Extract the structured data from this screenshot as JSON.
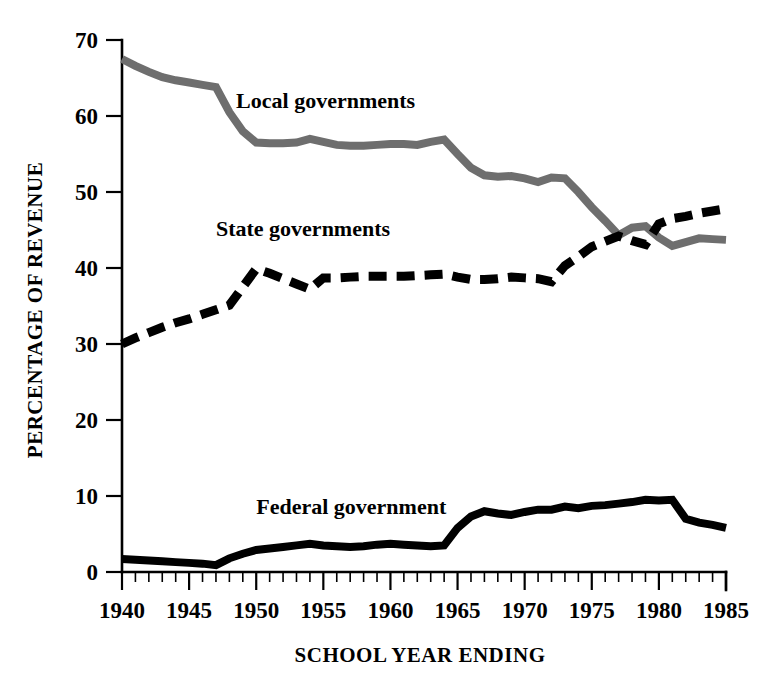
{
  "chart_data": {
    "type": "line",
    "title": "",
    "xlabel": "SCHOOL YEAR ENDING",
    "ylabel": "PERCENTAGE OF REVENUE",
    "xlim": [
      1940,
      1985
    ],
    "ylim": [
      0,
      70
    ],
    "grid": false,
    "legend_position": "inline-annotations",
    "x_tick_labels": [
      "1940",
      "1945",
      "1950",
      "1955",
      "1960",
      "1965",
      "1970",
      "1975",
      "1980",
      "1985"
    ],
    "x_tick_values": [
      1940,
      1945,
      1950,
      1955,
      1960,
      1965,
      1970,
      1975,
      1980,
      1985
    ],
    "x_minor_tick_step": 1,
    "y_tick_labels": [
      "0",
      "10",
      "20",
      "30",
      "40",
      "50",
      "60",
      "70"
    ],
    "y_tick_values": [
      0,
      10,
      20,
      30,
      40,
      50,
      60,
      70
    ],
    "x": [
      1940,
      1941,
      1942,
      1943,
      1944,
      1945,
      1946,
      1947,
      1948,
      1949,
      1950,
      1951,
      1952,
      1953,
      1954,
      1955,
      1956,
      1957,
      1958,
      1959,
      1960,
      1961,
      1962,
      1963,
      1964,
      1965,
      1966,
      1967,
      1968,
      1969,
      1970,
      1971,
      1972,
      1973,
      1974,
      1975,
      1976,
      1977,
      1978,
      1979,
      1980,
      1981,
      1982,
      1983,
      1984,
      1985
    ],
    "series": [
      {
        "name": "Local governments",
        "label": "Local governments",
        "color": "#6e6e6e",
        "style": "solid",
        "label_x": 1948.5,
        "label_y": 61.0,
        "values": [
          67.5,
          66.6,
          65.8,
          65.1,
          64.7,
          64.4,
          64.1,
          63.8,
          60.5,
          58.0,
          56.5,
          56.4,
          56.4,
          56.5,
          57.0,
          56.6,
          56.2,
          56.1,
          56.1,
          56.2,
          56.3,
          56.3,
          56.2,
          56.6,
          56.9,
          55.0,
          53.2,
          52.2,
          52.0,
          52.1,
          51.8,
          51.3,
          51.9,
          51.8,
          50.0,
          48.0,
          46.2,
          44.3,
          45.3,
          45.5,
          44.0,
          42.9,
          43.4,
          43.9,
          43.8,
          43.7
        ]
      },
      {
        "name": "State governments",
        "label": "State governments",
        "color": "#000000",
        "style": "dashed",
        "label_x": 1947.0,
        "label_y": 44.2,
        "values": [
          30.0,
          30.8,
          31.5,
          32.2,
          32.8,
          33.3,
          33.9,
          34.5,
          35.1,
          37.5,
          39.9,
          39.3,
          38.6,
          37.9,
          37.2,
          38.7,
          38.7,
          38.8,
          38.9,
          38.9,
          38.9,
          38.9,
          39.0,
          39.1,
          39.2,
          38.8,
          38.5,
          38.5,
          38.6,
          38.8,
          38.7,
          38.6,
          38.2,
          40.3,
          41.5,
          42.8,
          43.5,
          44.2,
          43.6,
          43.1,
          45.8,
          46.5,
          46.8,
          47.2,
          47.5,
          47.8
        ]
      },
      {
        "name": "Federal government",
        "label": "Federal government",
        "color": "#000000",
        "style": "solid",
        "label_x": 1950.0,
        "label_y": 7.6,
        "values": [
          1.7,
          1.6,
          1.5,
          1.4,
          1.3,
          1.2,
          1.1,
          0.9,
          1.8,
          2.4,
          2.9,
          3.1,
          3.3,
          3.5,
          3.7,
          3.5,
          3.4,
          3.3,
          3.4,
          3.6,
          3.7,
          3.6,
          3.5,
          3.4,
          3.5,
          5.8,
          7.3,
          8.0,
          7.7,
          7.5,
          7.9,
          8.2,
          8.2,
          8.6,
          8.4,
          8.7,
          8.8,
          9.0,
          9.2,
          9.5,
          9.4,
          9.5,
          7.0,
          6.5,
          6.2,
          5.8
        ]
      }
    ]
  }
}
